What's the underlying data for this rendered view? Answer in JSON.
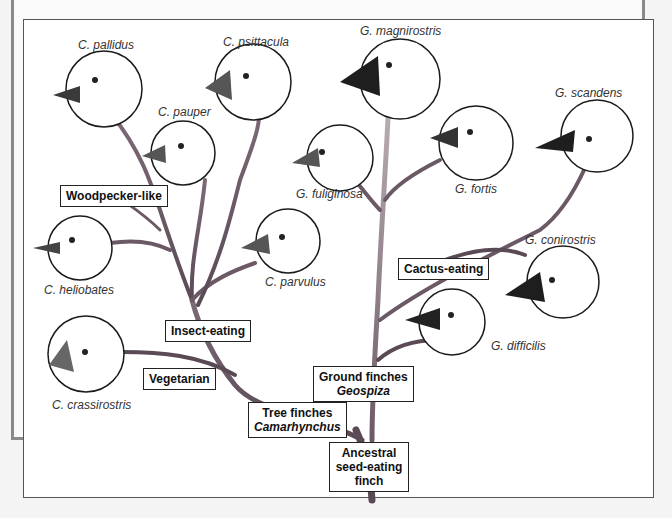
{
  "diagram": {
    "type": "phylogenetic-tree",
    "root": "Ancestral seed-eating finch",
    "groups": [
      {
        "id": "tree",
        "title": "Tree finches",
        "genus": "Camarhynchus"
      },
      {
        "id": "ground",
        "title": "Ground finches",
        "genus": "Geospiza"
      }
    ],
    "diet_labels": {
      "woodpecker": "Woodpecker-like",
      "insect": "Insect-eating",
      "vegetarian": "Vegetarian",
      "cactus": "Cactus-eating"
    },
    "root_label": {
      "line1": "Ancestral",
      "line2": "seed-eating",
      "line3": "finch"
    },
    "species": [
      {
        "name": "C. pallidus",
        "group": "tree",
        "diet": "Woodpecker-like"
      },
      {
        "name": "C. psittacula",
        "group": "tree",
        "diet": "Insect-eating"
      },
      {
        "name": "C. pauper",
        "group": "tree",
        "diet": "Insect-eating"
      },
      {
        "name": "C. heliobates",
        "group": "tree",
        "diet": "Insect-eating"
      },
      {
        "name": "C. parvulus",
        "group": "tree",
        "diet": "Insect-eating"
      },
      {
        "name": "C. crassirostris",
        "group": "tree",
        "diet": "Vegetarian"
      },
      {
        "name": "G. magnirostris",
        "group": "ground",
        "diet": "Seed-eating"
      },
      {
        "name": "G. fuliginosa",
        "group": "ground",
        "diet": "Seed-eating"
      },
      {
        "name": "G. fortis",
        "group": "ground",
        "diet": "Seed-eating"
      },
      {
        "name": "G. scandens",
        "group": "ground",
        "diet": "Cactus-eating"
      },
      {
        "name": "G. conirostris",
        "group": "ground",
        "diet": "Cactus-eating"
      },
      {
        "name": "G. difficilis",
        "group": "ground",
        "diet": "Seed-eating"
      }
    ]
  },
  "colors": {
    "branch_dark": "#5a4a55",
    "branch_light": "#a99aa2",
    "beak_dark": "#222222",
    "beak_gray": "#6a6a6a",
    "circle": "#1a1a1a"
  }
}
